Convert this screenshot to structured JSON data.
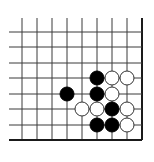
{
  "diagram": {
    "type": "go-board-corner",
    "colors": {
      "background": "#ffffff",
      "line": "#3a3a3a",
      "edge": "#1a1a1a",
      "black_stone": "#000000",
      "white_stone_fill": "#ffffff",
      "white_stone_stroke": "#333333"
    },
    "grid": {
      "columns_x": [
        22,
        37,
        52,
        67,
        82,
        97,
        112,
        127,
        142
      ],
      "rows_y": [
        32,
        47,
        63,
        78,
        94,
        109,
        125,
        140
      ],
      "line_start_x": 9,
      "line_start_y": 18,
      "right_edge_x": 142,
      "bottom_edge_y": 140
    },
    "stone_radius": 7,
    "stones": [
      {
        "color": "black",
        "col": 5,
        "row": 3
      },
      {
        "color": "white",
        "col": 6,
        "row": 3
      },
      {
        "color": "white",
        "col": 7,
        "row": 3
      },
      {
        "color": "black",
        "col": 3,
        "row": 4
      },
      {
        "color": "black",
        "col": 5,
        "row": 4
      },
      {
        "color": "white",
        "col": 6,
        "row": 4
      },
      {
        "color": "white",
        "col": 4,
        "row": 5
      },
      {
        "color": "white",
        "col": 5,
        "row": 5
      },
      {
        "color": "black",
        "col": 6,
        "row": 5
      },
      {
        "color": "white",
        "col": 7,
        "row": 5
      },
      {
        "color": "black",
        "col": 5,
        "row": 6
      },
      {
        "color": "black",
        "col": 6,
        "row": 6
      },
      {
        "color": "white",
        "col": 7,
        "row": 6
      }
    ]
  }
}
